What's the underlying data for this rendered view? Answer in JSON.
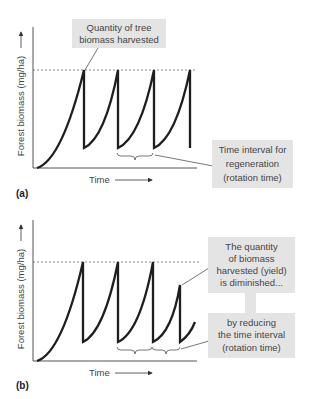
{
  "colors": {
    "curve": "#1e1e1e",
    "axis": "#555555",
    "dashed": "#555555",
    "box_fill": "#e4e4e4",
    "text": "#444444"
  },
  "panels": [
    {
      "id": "a",
      "panel_label": "(a)",
      "y_axis_label": "Forest biomass (mg/ha)",
      "x_axis_label": "Time",
      "callouts": [
        {
          "lines": [
            "Quantity of tree",
            "biomass harvested"
          ]
        },
        {
          "lines": [
            "Time interval for",
            "regeneration",
            "(rotation time)"
          ]
        }
      ]
    },
    {
      "id": "b",
      "panel_label": "(b)",
      "y_axis_label": "Forest biomass (mg/ha)",
      "x_axis_label": "Time",
      "callouts": [
        {
          "lines": [
            "The quantity",
            "of biomass",
            "harvested (yield)",
            "is diminished..."
          ]
        },
        {
          "lines": [
            "by reducing",
            "the time interval",
            "(rotation time)"
          ]
        }
      ]
    }
  ]
}
